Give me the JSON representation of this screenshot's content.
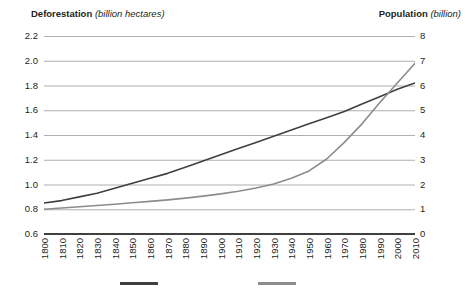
{
  "header": {
    "left_bold": "Deforestation",
    "left_italic": "(billion hectares)",
    "right_bold": "Population",
    "right_italic": "(billion)"
  },
  "colors": {
    "deforestation_line": "#3f3f3f",
    "population_line": "#8c8c8c",
    "gridline": "#a6a6a6",
    "axis": "#404040",
    "text": "#231f20"
  },
  "chart_data": {
    "type": "line",
    "title": "",
    "xlabel": "",
    "grid": true,
    "legend": "bottom",
    "x": [
      1800,
      1810,
      1820,
      1830,
      1840,
      1850,
      1860,
      1870,
      1880,
      1890,
      1900,
      1910,
      1920,
      1930,
      1940,
      1950,
      1960,
      1970,
      1980,
      1990,
      2000,
      2010
    ],
    "xtick_labels": [
      "1800",
      "1810",
      "1820",
      "1830",
      "1840",
      "1850",
      "1860",
      "1870",
      "1880",
      "1890",
      "1900",
      "1910",
      "1920",
      "1930",
      "1940",
      "1950",
      "1960",
      "1970",
      "1980",
      "1990",
      "2000",
      "2010"
    ],
    "axes": [
      {
        "id": "left",
        "name": "Deforestation",
        "unit": "billion hectares",
        "ylim": [
          0.6,
          2.2
        ],
        "ytick_labels": [
          "2.2",
          "2.0",
          "1.8",
          "1.6",
          "1.4",
          "1.2",
          "1.0",
          "0.8",
          "0.6"
        ],
        "ytick_values": [
          2.2,
          2.0,
          1.8,
          1.6,
          1.4,
          1.2,
          1.0,
          0.8,
          0.6
        ]
      },
      {
        "id": "right",
        "name": "Population",
        "unit": "billion",
        "ylim": [
          0,
          8
        ],
        "ytick_labels": [
          "8",
          "7",
          "6",
          "5",
          "4",
          "3",
          "2",
          "1",
          "0"
        ],
        "ytick_values": [
          8,
          7,
          6,
          5,
          4,
          3,
          2,
          1,
          0
        ]
      }
    ],
    "series": [
      {
        "name": "Deforestation",
        "axis": "left",
        "color": "#3f3f3f",
        "legend_label": "",
        "values": [
          0.85,
          0.87,
          0.9,
          0.93,
          0.97,
          1.01,
          1.05,
          1.09,
          1.14,
          1.19,
          1.24,
          1.29,
          1.34,
          1.39,
          1.44,
          1.49,
          1.54,
          1.59,
          1.65,
          1.71,
          1.77,
          1.82
        ]
      },
      {
        "name": "Population",
        "axis": "right",
        "color": "#8c8c8c",
        "legend_label": "",
        "values": [
          1.0,
          1.05,
          1.1,
          1.15,
          1.2,
          1.26,
          1.32,
          1.38,
          1.45,
          1.53,
          1.62,
          1.73,
          1.86,
          2.02,
          2.25,
          2.55,
          3.03,
          3.7,
          4.45,
          5.3,
          6.1,
          6.9
        ]
      }
    ]
  },
  "legend": {
    "items": [
      {
        "name": "deforestation",
        "color": "#3f3f3f",
        "label": "",
        "x": 120,
        "width": 38
      },
      {
        "name": "population",
        "color": "#8c8c8c",
        "label": "",
        "x": 258,
        "width": 38
      }
    ]
  }
}
